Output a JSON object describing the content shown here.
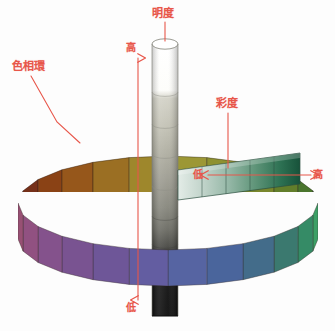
{
  "figure": {
    "title_ghost": "",
    "background_color": "#ffffff",
    "annotation_color": "#e8564a"
  },
  "labels": {
    "value_axis": "明度",
    "hue_circle": "色相環",
    "chroma_axis": "彩度",
    "value_high": "高",
    "value_low": "低",
    "chroma_low": "低",
    "chroma_high": "高"
  },
  "chart_data": {
    "type": "diagram",
    "axes": [
      {
        "name": "明度",
        "english": "value",
        "orientation": "vertical",
        "low_label": "低",
        "high_label": "高",
        "low_color": "#111111",
        "high_color": "#ffffff"
      },
      {
        "name": "彩度",
        "english": "chroma",
        "orientation": "horizontal",
        "low_label": "低",
        "high_label": "高",
        "low_color": "#d8e3de",
        "high_color": "#18533a"
      },
      {
        "name": "色相環",
        "english": "hue circle",
        "orientation": "ring",
        "low_label": "",
        "high_label": ""
      }
    ],
    "value_scale": [
      {
        "step": 10,
        "color": "#ffffff"
      },
      {
        "step": 9,
        "color": "#fbfbf8"
      },
      {
        "step": 8,
        "color": "#cfcec3"
      },
      {
        "step": 7,
        "color": "#b9b8ab"
      },
      {
        "step": 6,
        "color": "#a8a79a"
      },
      {
        "step": 5,
        "color": "#93938a"
      },
      {
        "step": 4,
        "color": "#7a7a72"
      },
      {
        "step": 3,
        "color": "#5a5a54"
      },
      {
        "step": 2,
        "color": "#33332f"
      },
      {
        "step": 1,
        "color": "#111111"
      },
      {
        "step": 0,
        "color": "#0a0a0a"
      }
    ],
    "chroma_scale": [
      "#dfe8e3",
      "#b9ccc2",
      "#8fb3a2",
      "#5e9478",
      "#2f7354",
      "#18533a"
    ],
    "hue_ring": {
      "segment_count": 24,
      "colors": [
        "#d9d24a",
        "#cfd348",
        "#b9cf46",
        "#9cc945",
        "#79c04a",
        "#4fae58",
        "#2f9a5c",
        "#27835c",
        "#2a6e63",
        "#2f5d7e",
        "#32508f",
        "#3a4a93",
        "#494291",
        "#5b3f8a",
        "#6b4186",
        "#7a4382",
        "#8a4579",
        "#92456b",
        "#a8413f",
        "#c24f2a",
        "#dc6a22",
        "#e5852a",
        "#e2a233",
        "#dcbb3d"
      ]
    }
  },
  "elements": {
    "cylinder_name": "value-cylinder",
    "ring_name": "hue-ring",
    "strip_name": "chroma-strip"
  }
}
